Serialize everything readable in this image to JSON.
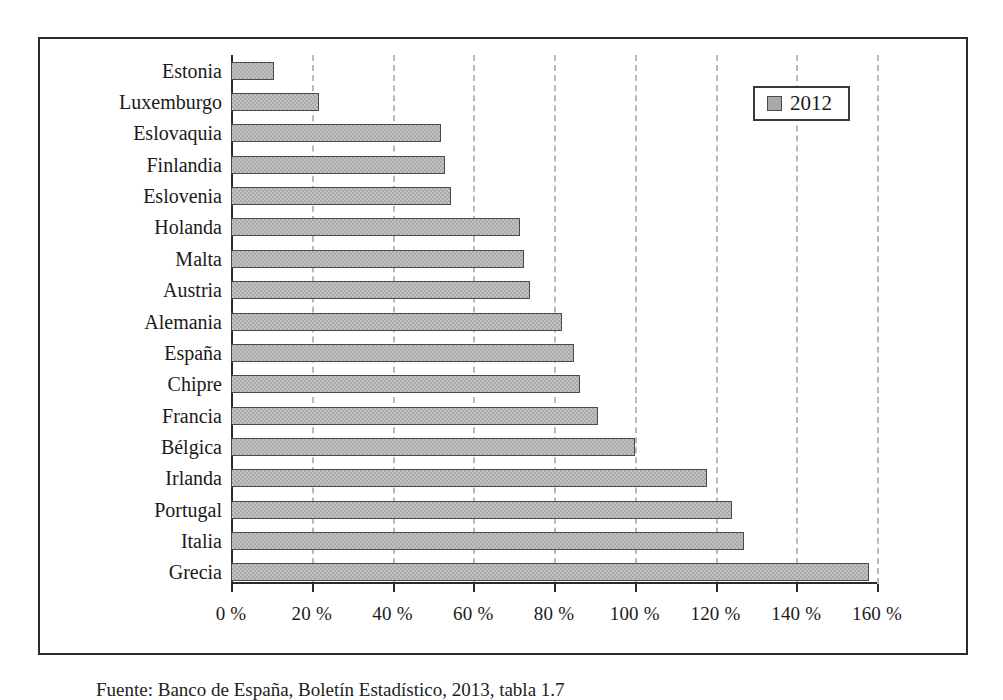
{
  "chart_data": {
    "type": "bar",
    "orientation": "horizontal",
    "title": "",
    "xlabel": "",
    "ylabel": "",
    "xlim": [
      0,
      160
    ],
    "xticks": [
      0,
      20,
      40,
      60,
      80,
      100,
      120,
      140,
      160
    ],
    "xticklabels": [
      "0 %",
      "20 %",
      "40 %",
      "60 %",
      "80 %",
      "100 %",
      "120 %",
      "140 %",
      "160 %"
    ],
    "grid": "vertical-dashed",
    "legend": {
      "position": "top-right",
      "entries": [
        {
          "label": "2012",
          "color": "#a9a9a9"
        }
      ]
    },
    "categories": [
      "Estonia",
      "Luxemburgo",
      "Eslovaquia",
      "Finlandia",
      "Eslovenia",
      "Holanda",
      "Malta",
      "Austria",
      "Alemania",
      "España",
      "Chipre",
      "Francia",
      "Bélgica",
      "Irlanda",
      "Portugal",
      "Italia",
      "Grecia"
    ],
    "series": [
      {
        "name": "2012",
        "values": [
          10.6,
          21.8,
          52.0,
          53.0,
          54.5,
          71.5,
          72.5,
          74.0,
          82.0,
          85.0,
          86.5,
          91.0,
          100.0,
          118.0,
          124.0,
          127.0,
          158.0
        ]
      }
    ],
    "units": "%"
  },
  "legend": {
    "label": "2012"
  },
  "caption": {
    "text": "Fuente: Banco de España, Boletín Estadístico, 2013, tabla 1.7"
  }
}
